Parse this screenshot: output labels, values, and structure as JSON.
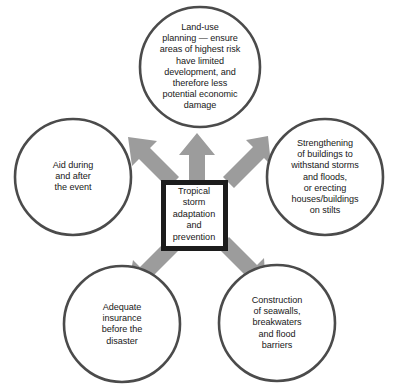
{
  "diagram": {
    "title": "Tropical storm adaptation and prevention",
    "type": "radial-hub-and-spoke",
    "colors": {
      "background": "#ffffff",
      "circle_stroke": "#4b4b4b",
      "arrow_fill": "#9c9c9c",
      "center_box_border": "#1c1c1c",
      "text": "#181818"
    },
    "center": {
      "label": "Tropical storm adaptation and prevention",
      "lines": [
        "Tropical",
        "storm",
        "adaptation",
        "and",
        "prevention"
      ]
    },
    "nodes": [
      {
        "id": "land-use-planning",
        "position": "top",
        "label": "Land-use planning — ensure areas of highest risk have limited development, and therefore less potential economic damage",
        "lines": [
          "Land-use",
          "planning — ensure",
          "areas of highest risk",
          "have limited",
          "development, and",
          "therefore less",
          "potential economic",
          "damage"
        ]
      },
      {
        "id": "strengthening-buildings",
        "position": "right",
        "label": "Strengthening of buildings to withstand storms and floods, or erecting houses/buildings on stilts",
        "lines": [
          "Strengthening",
          "of buildings to",
          "withstand storms",
          "and floods,",
          "or erecting",
          "houses/buildings",
          "on stilts"
        ]
      },
      {
        "id": "seawalls-construction",
        "position": "bottom-right",
        "label": "Construction of seawalls, breakwaters and flood barriers",
        "lines": [
          "Construction",
          "of seawalls,",
          "breakwaters",
          "and flood",
          "barriers"
        ]
      },
      {
        "id": "adequate-insurance",
        "position": "bottom-left",
        "label": "Adequate insurance before the disaster",
        "lines": [
          "Adequate",
          "insurance",
          "before the",
          "disaster"
        ]
      },
      {
        "id": "aid-during-after",
        "position": "left",
        "label": "Aid during and after the event",
        "lines": [
          "Aid during",
          "and after",
          "the event"
        ]
      }
    ]
  }
}
